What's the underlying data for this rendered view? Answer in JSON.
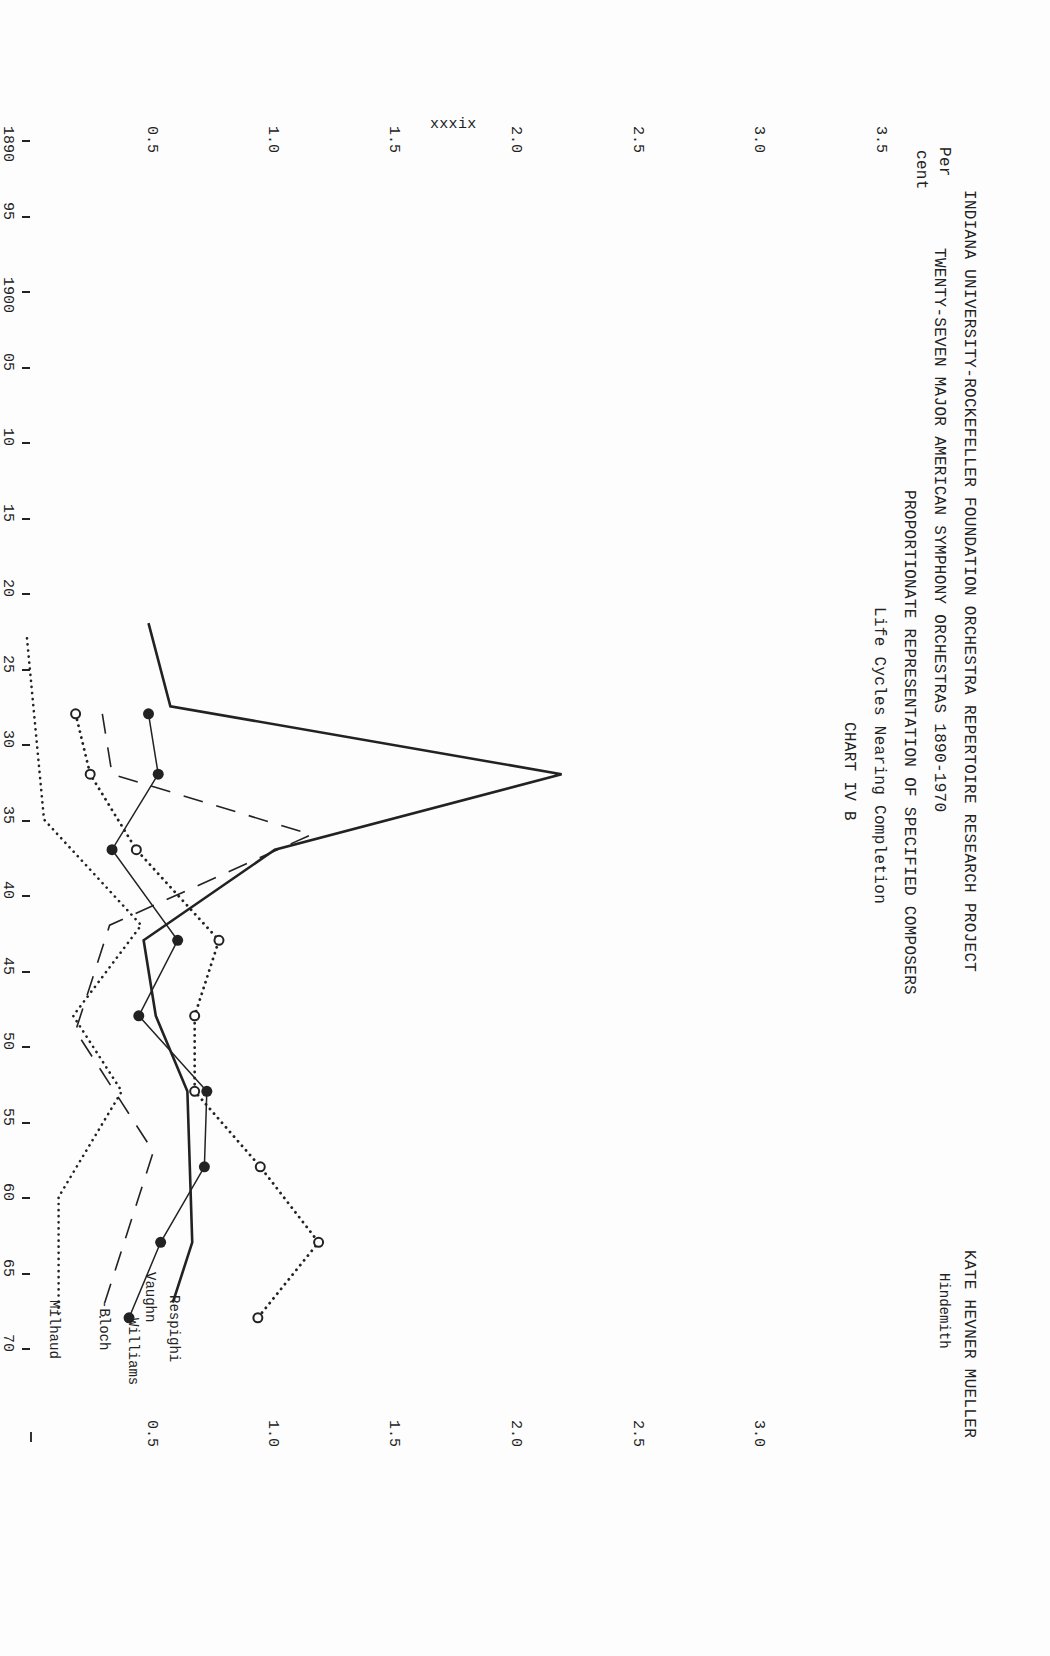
{
  "header": {
    "project": "INDIANA UNIVERSITY-ROCKEFELLER FOUNDATION ORCHESTRA REPERTOIRE RESEARCH PROJECT",
    "author": "KATE HEVNER MUELLER",
    "line2": "TWENTY-SEVEN MAJOR AMERICAN SYMPHONY ORCHESTRAS   1890-1970",
    "line3": "PROPORTIONATE REPRESENTATION OF SPECIFIED COMPOSERS",
    "line4": "Life Cycles Nearing Completion",
    "chart_id": "CHART IV B",
    "page_number": "xxxix"
  },
  "axes": {
    "y_label_line1": "Per",
    "y_label_line2": "cent",
    "y_ticks_left": [
      "0.5",
      "1.0",
      "1.5",
      "2.0",
      "2.5",
      "3.0",
      "3.5"
    ],
    "y_ticks_right": [
      "0.5",
      "1.0",
      "1.5",
      "2.0",
      "2.5",
      "3.0"
    ],
    "x_ticks": [
      "1890",
      "95",
      "1900",
      "05",
      "10",
      "15",
      "20",
      "25",
      "30",
      "35",
      "40",
      "45",
      "50",
      "55",
      "60",
      "65",
      "70"
    ]
  },
  "legend": {
    "hindemith": "Hindemith",
    "respighi": "Respighi",
    "vaughn": "Vaughn",
    "williams": "Williams",
    "bloch": "-Bloch",
    "milhaud": "Milhaud"
  },
  "chart_data": {
    "type": "line",
    "subtitle": "Life Cycles Nearing Completion — CHART IV B",
    "xlabel": "Year",
    "ylabel": "Per cent",
    "xlim": [
      1890,
      1970
    ],
    "ylim": [
      0,
      3.5
    ],
    "grid": false,
    "orientation_note": "page rotated 90 degrees clockwise",
    "series": [
      {
        "name": "Respighi",
        "style": "thick-solid",
        "x": [
          1922,
          1927.5,
          1932,
          1937,
          1943,
          1948,
          1953,
          1958,
          1963,
          1967
        ],
        "values": [
          0.5,
          0.59,
          2.2,
          1.02,
          0.48,
          0.53,
          0.66,
          0.67,
          0.68,
          0.6
        ]
      },
      {
        "name": "Vaughn Williams",
        "style": "thin-solid-filled-dots",
        "x": [
          1928,
          1932,
          1937,
          1943,
          1948,
          1953,
          1958,
          1963,
          1968
        ],
        "values": [
          0.5,
          0.54,
          0.35,
          0.62,
          0.46,
          0.74,
          0.73,
          0.55,
          0.42
        ]
      },
      {
        "name": "Hindemith",
        "style": "dotted-open-circles",
        "x": [
          1928,
          1932,
          1937,
          1943,
          1948,
          1953,
          1958,
          1963,
          1968
        ],
        "values": [
          0.2,
          0.26,
          0.45,
          0.79,
          0.69,
          0.69,
          0.96,
          1.2,
          0.95
        ]
      },
      {
        "name": "Bloch",
        "style": "dashed",
        "x": [
          1928,
          1932,
          1936,
          1942,
          1949,
          1957,
          1968
        ],
        "values": [
          0.31,
          0.35,
          1.17,
          0.34,
          0.2,
          0.52,
          0.3
        ]
      },
      {
        "name": "Milhaud",
        "style": "dotted",
        "x": [
          1923,
          1935,
          1942,
          1948,
          1953,
          1960,
          1968
        ],
        "values": [
          0.0,
          0.07,
          0.47,
          0.19,
          0.39,
          0.13,
          0.13
        ]
      }
    ]
  }
}
